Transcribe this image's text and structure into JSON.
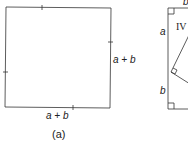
{
  "figure_a": {
    "right_label": "a + b",
    "bottom_label": "a + b",
    "caption": "(a)"
  },
  "figure_b": {
    "top_label": "b",
    "left_top_label": "a",
    "left_bottom_label": "b",
    "region_label": "IV"
  }
}
